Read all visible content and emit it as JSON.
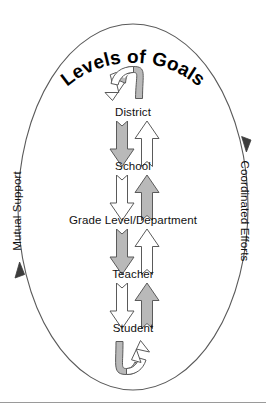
{
  "figure": {
    "title": "Levels of Goals",
    "title_shape": "arched-along-ellipse-top",
    "colors": {
      "arrow_fill_gray": "#b9b9b9",
      "arrow_fill_white": "#ffffff",
      "stroke": "#4a4a4a",
      "text": "#111111",
      "ellipse_stroke": "#5a5a5a",
      "rule": "#9a9a9a",
      "background": "#ffffff"
    },
    "levels": [
      {
        "id": "district",
        "label": "District"
      },
      {
        "id": "school",
        "label": "School"
      },
      {
        "id": "grade-level",
        "label": "Grade Level/Department"
      },
      {
        "id": "teacher",
        "label": "Teacher"
      },
      {
        "id": "student",
        "label": "Student"
      }
    ],
    "arrow_pairs": [
      {
        "from": "district",
        "to": "school",
        "down_fill": "gray",
        "up_fill": "white"
      },
      {
        "from": "school",
        "to": "grade-level",
        "down_fill": "white",
        "up_fill": "gray"
      },
      {
        "from": "grade-level",
        "to": "teacher",
        "down_fill": "gray",
        "up_fill": "white"
      },
      {
        "from": "teacher",
        "to": "student",
        "down_fill": "white",
        "up_fill": "gray"
      }
    ],
    "curved_arrows": [
      {
        "id": "top-loop",
        "position": "above-district",
        "band_fill": "gray",
        "head_fill": "white",
        "head_direction": "down"
      },
      {
        "id": "bottom-loop",
        "position": "below-student",
        "band_fill": "gray",
        "head_fill": "white",
        "head_direction": "up"
      }
    ],
    "side_labels": {
      "left": {
        "id": "mutual-support",
        "text": "Mutual Support",
        "orientation": "bottom-to-top",
        "arrow_direction": "up"
      },
      "right": {
        "id": "coordinated-efforts",
        "text": "Coordinated Efforts",
        "orientation": "top-to-bottom",
        "arrow_direction": "down"
      }
    }
  }
}
